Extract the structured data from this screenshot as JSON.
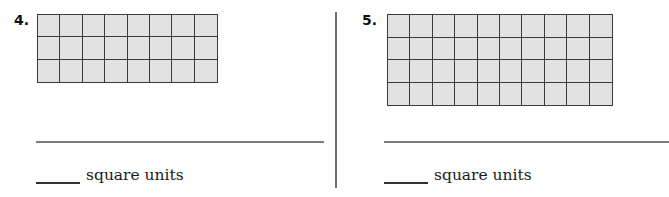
{
  "problems": [
    {
      "number": "4.",
      "grid": {
        "columns": 8,
        "rows": 3
      },
      "answer_unit_label": "square units"
    },
    {
      "number": "5.",
      "grid": {
        "columns": 10,
        "rows": 4
      },
      "answer_unit_label": "square units"
    }
  ],
  "colors": {
    "grid_fill": "#e2e2e2",
    "grid_line": "#3a3a3a",
    "rule_line": "#7a7a7a"
  }
}
